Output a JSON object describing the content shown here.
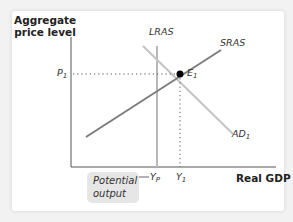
{
  "diagram": {
    "axes": {
      "y_label": "Aggregate price level",
      "x_label": "Real GDP"
    },
    "curves": {
      "lras": "LRAS",
      "sras": "SRAS",
      "ad": {
        "main": "AD",
        "sub": "1"
      }
    },
    "equilibrium": {
      "main": "E",
      "sub": "1"
    },
    "price_tick": {
      "main": "P",
      "sub": "1"
    },
    "output_ticks": {
      "potential": {
        "main": "Y",
        "sub": "P"
      },
      "actual": {
        "main": "Y",
        "sub": "1"
      }
    },
    "callout": {
      "line1": "Potential",
      "line2": "output"
    },
    "colors": {
      "curve": "#9a9a9a",
      "sras": "#7a7a7a",
      "axis": "#555555",
      "point": "#000000",
      "callout_bg": "#e6e6e6"
    }
  }
}
